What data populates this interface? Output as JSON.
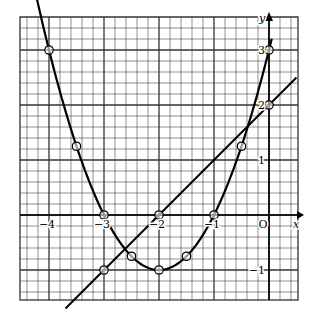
{
  "chart_data": {
    "type": "line",
    "title": "",
    "xlabel": "x",
    "ylabel": "y",
    "xlim": [
      -4.5,
      0.5
    ],
    "ylim": [
      -1.55,
      3.1
    ],
    "grid": true,
    "grid_minor_step": 0.2,
    "grid_major_step": 1,
    "legend": "none",
    "origin_label": "O",
    "x_ticks": [
      {
        "value": -4,
        "label": "−4"
      },
      {
        "value": -3,
        "label": "−3"
      },
      {
        "value": -2,
        "label": "−2"
      },
      {
        "value": -1,
        "label": "−1"
      }
    ],
    "y_ticks": [
      {
        "value": 3,
        "label": "3"
      },
      {
        "value": 2,
        "label": "2"
      },
      {
        "value": 1,
        "label": "1"
      },
      {
        "value": -1,
        "label": "−1"
      }
    ],
    "series": [
      {
        "name": "parabola y = x² + 4x + 3",
        "kind": "curve",
        "x": [
          -4,
          -3.5,
          -3,
          -2.5,
          -2,
          -1.5,
          -1,
          -0.5,
          0
        ],
        "y": [
          3,
          1.25,
          0,
          -0.75,
          -1,
          -0.75,
          0,
          1.25,
          3
        ],
        "marked_points": true
      },
      {
        "name": "line y = x + 2",
        "kind": "line",
        "x": [
          -3,
          -2,
          0
        ],
        "y": [
          -1,
          0,
          2
        ],
        "marked_points": true
      }
    ]
  }
}
